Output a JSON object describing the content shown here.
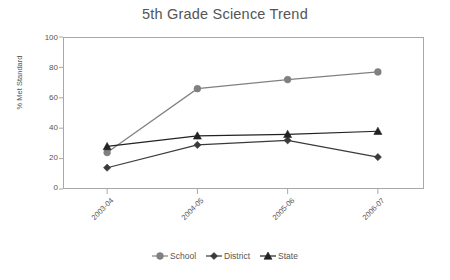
{
  "chart_data": {
    "type": "line",
    "title": "5th Grade Science Trend",
    "xlabel": "",
    "ylabel": "% Met Standard",
    "categories": [
      "2003-04",
      "2004-05",
      "2005-06",
      "2006-07"
    ],
    "ylim": [
      0,
      100
    ],
    "yticks": [
      0,
      20,
      40,
      60,
      80,
      100
    ],
    "grid": false,
    "legend_position": "bottom",
    "series": [
      {
        "name": "School",
        "marker": "circle",
        "color": "#808080",
        "values": [
          24,
          66,
          72,
          77
        ]
      },
      {
        "name": "District",
        "marker": "diamond",
        "color": "#3a3a3a",
        "values": [
          14,
          29,
          32,
          21
        ]
      },
      {
        "name": "State",
        "marker": "triangle",
        "color": "#222222",
        "values": [
          28,
          35,
          36,
          38
        ]
      }
    ]
  },
  "legend": {
    "items": [
      {
        "label": "School",
        "marker_name": "circle-marker-icon"
      },
      {
        "label": "District",
        "marker_name": "diamond-marker-icon"
      },
      {
        "label": "State",
        "marker_name": "triangle-marker-icon"
      }
    ]
  }
}
